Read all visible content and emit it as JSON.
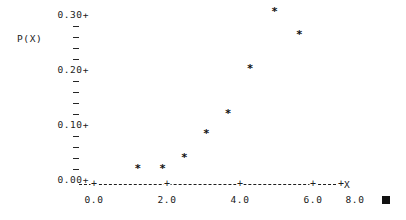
{
  "chart_data": {
    "type": "scatter",
    "title": "",
    "xlabel": "X",
    "ylabel": "P(X)",
    "xlim": [
      -0.6,
      8.8
    ],
    "ylim": [
      0.0,
      0.315
    ],
    "grid": false,
    "legend": null,
    "marker": "*",
    "x": [
      1.6,
      2.5,
      3.3,
      4.1,
      4.9,
      5.7,
      6.6,
      7.5
    ],
    "y": [
      0.022,
      0.022,
      0.042,
      0.085,
      0.122,
      0.203,
      0.307,
      0.265
    ],
    "x_ticks": [
      "0.0",
      "2.0",
      "4.0",
      "6.0",
      "8.0"
    ],
    "x_tick_values": [
      0.0,
      2.0,
      4.0,
      6.0,
      8.0
    ],
    "y_ticks": [
      "0.30+",
      "0.20+",
      "0.10+",
      "0.00+"
    ],
    "y_tick_values": [
      0.3,
      0.2,
      0.1,
      0.0
    ],
    "y_minor_per_interval": 4,
    "axis_color": "#1d1d1d",
    "marker_color": "#111111"
  },
  "axes": {
    "y_title": "P(X)",
    "x_title": "+X"
  },
  "markers": {
    "corner_square": "filled-square"
  }
}
